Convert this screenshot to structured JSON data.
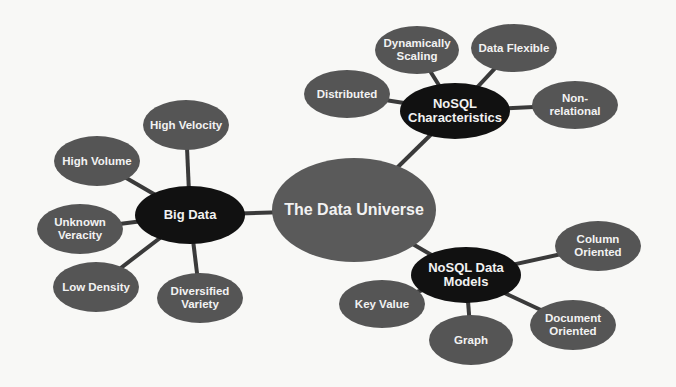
{
  "diagram": {
    "title": "The Data Universe",
    "colors": {
      "background": "#f8f8f6",
      "leaf_fill": "#555555",
      "hub_fill": "#111111",
      "center_fill": "#5a5a5a",
      "edge": "#3a3a3a",
      "text": "#f2f2f2"
    },
    "center": {
      "label": "The Data Universe",
      "cx": 354,
      "cy": 210,
      "rx": 82,
      "ry": 52,
      "font": 16
    },
    "hubs": [
      {
        "id": "big-data",
        "label": "Big Data",
        "cx": 190,
        "cy": 215,
        "rx": 55,
        "ry": 29,
        "font": 13,
        "leaves": [
          {
            "label": "High Velocity",
            "cx": 186,
            "cy": 125,
            "rx": 43,
            "ry": 25
          },
          {
            "label": "High Volume",
            "cx": 97,
            "cy": 161,
            "rx": 43,
            "ry": 25
          },
          {
            "label": "Unknown\nVeracity",
            "cx": 80,
            "cy": 229,
            "rx": 43,
            "ry": 25
          },
          {
            "label": "Low Density",
            "cx": 96,
            "cy": 287,
            "rx": 43,
            "ry": 25
          },
          {
            "label": "Diversified\nVariety",
            "cx": 200,
            "cy": 298,
            "rx": 43,
            "ry": 25
          }
        ]
      },
      {
        "id": "nosql-characteristics",
        "label": "NoSQL\nCharacteristics",
        "cx": 455,
        "cy": 111,
        "rx": 55,
        "ry": 28,
        "font": 13,
        "leaves": [
          {
            "label": "Dynamically\nScaling",
            "cx": 417,
            "cy": 50,
            "rx": 42,
            "ry": 24
          },
          {
            "label": "Data Flexible",
            "cx": 514,
            "cy": 48,
            "rx": 43,
            "ry": 24
          },
          {
            "label": "Distributed",
            "cx": 347,
            "cy": 94,
            "rx": 43,
            "ry": 24
          },
          {
            "label": "Non-\nrelational",
            "cx": 575,
            "cy": 105,
            "rx": 43,
            "ry": 24
          }
        ]
      },
      {
        "id": "nosql-data-models",
        "label": "NoSQL Data\nModels",
        "cx": 466,
        "cy": 275,
        "rx": 55,
        "ry": 28,
        "font": 13,
        "leaves": [
          {
            "label": "Column\nOriented",
            "cx": 598,
            "cy": 246,
            "rx": 43,
            "ry": 25
          },
          {
            "label": "Key Value",
            "cx": 382,
            "cy": 304,
            "rx": 43,
            "ry": 24
          },
          {
            "label": "Graph",
            "cx": 471,
            "cy": 340,
            "rx": 42,
            "ry": 25
          },
          {
            "label": "Document\nOriented",
            "cx": 573,
            "cy": 325,
            "rx": 43,
            "ry": 25
          }
        ]
      }
    ]
  }
}
